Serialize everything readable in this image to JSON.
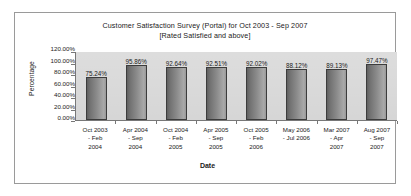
{
  "chart_data": {
    "type": "bar",
    "title": "Customer Satisfaction Survey (Portal) for Oct 2003 - Sep 2007",
    "subtitle": "[Rated Satisfied and above]",
    "xlabel": "Date",
    "ylabel": "Percentage",
    "ylim": [
      0,
      120
    ],
    "ytick_labels": [
      "120.00%",
      "100.00%",
      "80.00%",
      "60.00%",
      "40.00%",
      "20.00%",
      "0.00%"
    ],
    "ytick_values": [
      120,
      100,
      80,
      60,
      40,
      20,
      0
    ],
    "grid": false,
    "legend": false,
    "bar_color": "#8e8e8e",
    "plot_background": "#d6d6d6",
    "categories": [
      {
        "lines": [
          "Oct 2003",
          "- Feb",
          "2004"
        ]
      },
      {
        "lines": [
          "Apr 2004",
          "- Sep",
          "2004"
        ]
      },
      {
        "lines": [
          "Oct 2004",
          "- Feb",
          "2005"
        ]
      },
      {
        "lines": [
          "Apr 2005",
          "- Sep",
          "2005"
        ]
      },
      {
        "lines": [
          "Oct 2005",
          "- Feb",
          "2006"
        ]
      },
      {
        "lines": [
          "May 2006",
          "- Jul 2006"
        ]
      },
      {
        "lines": [
          "Mar 2007",
          "- Apr",
          "2007"
        ]
      },
      {
        "lines": [
          "Aug 2007",
          "- Sep",
          "2007"
        ]
      }
    ],
    "values": [
      75.24,
      95.86,
      92.64,
      92.51,
      92.02,
      88.12,
      89.13,
      97.47
    ],
    "data_labels": [
      "75.24%",
      "95.86%",
      "92.64%",
      "92.51%",
      "92.02%",
      "88.12%",
      "89.13%",
      "97.47%"
    ]
  }
}
